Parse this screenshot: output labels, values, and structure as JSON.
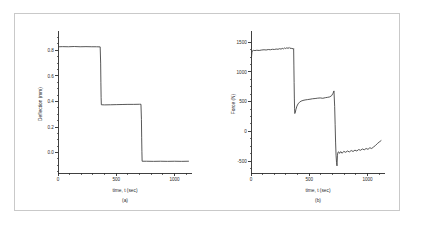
{
  "figure": {
    "background_color": "#ffffff",
    "frame_color": "#c9c9c9",
    "line_color": "#3a3a3a",
    "axis_color": "#2b2b2b"
  },
  "chart_data": [
    {
      "type": "line",
      "panel_label": "(a)",
      "title": "",
      "xlabel": "time, t (sec)",
      "ylabel": "Deflection (mm)",
      "xlim": [
        0,
        1150
      ],
      "ylim": [
        -0.16,
        0.92
      ],
      "xticks": [
        0,
        500,
        1000
      ],
      "xtick_labels": [
        "0",
        "500",
        "1000"
      ],
      "yticks": [
        0.0,
        0.2,
        0.4,
        0.6,
        0.8
      ],
      "ytick_labels": [
        "0.0",
        "0.2",
        "0.4",
        "0.6",
        "0.8"
      ],
      "grid": false,
      "legend": null,
      "series": [
        {
          "name": "Deflection",
          "x": [
            5,
            40,
            90,
            140,
            190,
            240,
            290,
            330,
            362,
            366,
            368,
            370,
            372,
            400,
            450,
            500,
            550,
            600,
            650,
            700,
            712,
            716,
            718,
            720,
            722,
            760,
            820,
            880,
            940,
            1000,
            1060,
            1120
          ],
          "y": [
            0.828,
            0.829,
            0.828,
            0.83,
            0.828,
            0.829,
            0.828,
            0.828,
            0.827,
            0.7,
            0.55,
            0.43,
            0.374,
            0.373,
            0.374,
            0.375,
            0.376,
            0.377,
            0.377,
            0.378,
            0.378,
            0.26,
            0.12,
            0.01,
            -0.068,
            -0.068,
            -0.069,
            -0.068,
            -0.069,
            -0.068,
            -0.069,
            -0.068
          ]
        }
      ]
    },
    {
      "type": "line",
      "panel_label": "(b)",
      "title": "",
      "xlabel": "time, t (sec)",
      "ylabel": "Force (N)",
      "xlim": [
        0,
        1150
      ],
      "ylim": [
        -700,
        1620
      ],
      "xticks": [
        0,
        500,
        1000
      ],
      "xtick_labels": [
        "0",
        "500",
        "1000"
      ],
      "yticks": [
        -500,
        0,
        500,
        1000,
        1500
      ],
      "ytick_labels": [
        "-500",
        "0",
        "500",
        "1000",
        "1500"
      ],
      "grid": false,
      "legend": null,
      "series": [
        {
          "name": "Force",
          "x": [
            4,
            8,
            14,
            22,
            34,
            50,
            70,
            92,
            112,
            130,
            148,
            166,
            184,
            200,
            216,
            232,
            246,
            258,
            268,
            278,
            288,
            298,
            308,
            318,
            328,
            336,
            344,
            352,
            358,
            362,
            366,
            368,
            370,
            372,
            374,
            376,
            380,
            386,
            394,
            404,
            416,
            430,
            446,
            464,
            484,
            506,
            528,
            550,
            572,
            594,
            616,
            638,
            658,
            676,
            692,
            704,
            712,
            718,
            722,
            726,
            730,
            734,
            738,
            742,
            746,
            752,
            760,
            770,
            782,
            796,
            812,
            828,
            844,
            860,
            876,
            892,
            908,
            924,
            940,
            956,
            972,
            988,
            1004,
            1020,
            1036,
            1052,
            1068,
            1084,
            1100,
            1116,
            1132
          ],
          "y": [
            1240,
            1330,
            1358,
            1362,
            1358,
            1364,
            1360,
            1368,
            1372,
            1368,
            1376,
            1372,
            1380,
            1376,
            1384,
            1380,
            1390,
            1382,
            1396,
            1386,
            1402,
            1392,
            1406,
            1394,
            1410,
            1392,
            1404,
            1386,
            1398,
            1382,
            1390,
            1100,
            820,
            560,
            380,
            300,
            318,
            372,
            424,
            462,
            490,
            508,
            520,
            528,
            534,
            540,
            548,
            552,
            558,
            562,
            556,
            566,
            572,
            580,
            600,
            640,
            680,
            420,
            120,
            -180,
            -400,
            -520,
            -580,
            -400,
            -352,
            -344,
            -370,
            -340,
            -368,
            -336,
            -352,
            -330,
            -346,
            -322,
            -338,
            -316,
            -330,
            -306,
            -318,
            -296,
            -310,
            -288,
            -302,
            -276,
            -288,
            -262,
            -238,
            -206,
            -180,
            -156
          ]
        }
      ]
    }
  ]
}
